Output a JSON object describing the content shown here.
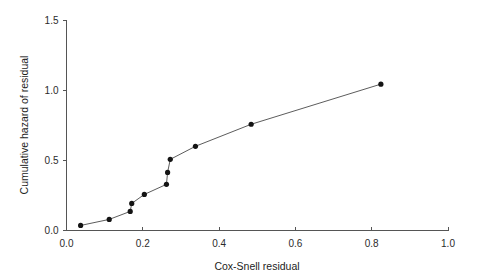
{
  "chart_data": {
    "type": "line",
    "title": "",
    "subtitle": "",
    "xlabel": "Cox-Snell residual",
    "ylabel": "Cumulative hazard of residual",
    "xlim": [
      0.0,
      1.0
    ],
    "ylim": [
      0.0,
      1.5
    ],
    "xticks": [
      0.0,
      0.2,
      0.4,
      0.6,
      0.8,
      1.0
    ],
    "xtick_labels": [
      "0.0",
      "0.2",
      "0.4",
      "0.6",
      "0.8",
      "1.0"
    ],
    "yticks": [
      0.0,
      0.5,
      1.0,
      1.5
    ],
    "ytick_labels": [
      "0.0",
      "0.5",
      "1.0",
      "1.5"
    ],
    "grid": false,
    "legend": null,
    "marker": "filled-circle",
    "marker_color": "#141414",
    "line_color": "#4a4a4a",
    "series": [
      {
        "name": "Cumulative hazard vs Cox-Snell residual",
        "x": [
          0.037,
          0.112,
          0.167,
          0.171,
          0.204,
          0.262,
          0.265,
          0.272,
          0.338,
          0.484,
          0.824
        ],
        "y": [
          0.036,
          0.079,
          0.136,
          0.193,
          0.257,
          0.329,
          0.414,
          0.507,
          0.6,
          0.757,
          1.043
        ]
      }
    ]
  },
  "axes": {
    "x_title": "Cox-Snell residual",
    "y_title": "Cumulative hazard of residual"
  }
}
